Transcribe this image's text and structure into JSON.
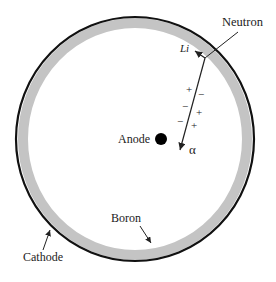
{
  "diagram": {
    "labels": {
      "neutron": "Neutron",
      "li": "Li",
      "alpha": "α",
      "anode": "Anode",
      "boron": "Boron",
      "cathode": "Cathode"
    },
    "charges": {
      "plus": "+",
      "minus": "−"
    },
    "colors": {
      "cathode": "#111111",
      "boron_layer": "#c4c4c4",
      "anode": "#000000",
      "lines": "#222222"
    }
  }
}
